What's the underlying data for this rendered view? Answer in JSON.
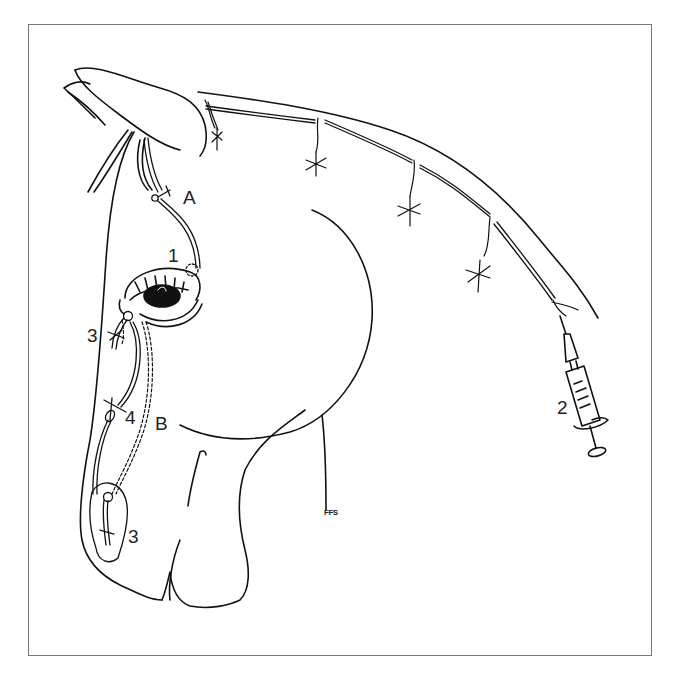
{
  "figure": {
    "labels": {
      "A": "A",
      "B": "B",
      "one": "1",
      "two": "2",
      "three_upper": "3",
      "three_lower": "3",
      "four": "4"
    },
    "signature": "FFS",
    "colors": {
      "line": "#111111",
      "frame": "#777777",
      "background": "#ffffff"
    }
  }
}
